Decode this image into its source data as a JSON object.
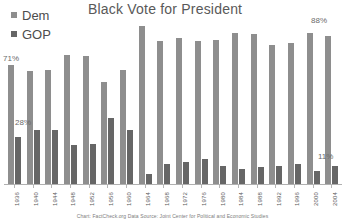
{
  "chart_data": {
    "type": "bar",
    "title": "Black Vote for President",
    "xlabel": "",
    "ylabel": "",
    "ylim": [
      0,
      100
    ],
    "grid": false,
    "legend_position": "top-left",
    "categories": [
      "1936",
      "1940",
      "1944",
      "1948",
      "1952",
      "1956",
      "1960",
      "1964",
      "1968",
      "1972",
      "1976",
      "1980",
      "1984",
      "1988",
      "1992",
      "1996",
      "2000",
      "2004"
    ],
    "series": [
      {
        "name": "Dem",
        "color": "#8e8e8e",
        "values": [
          71,
          67,
          68,
          77,
          76,
          61,
          68,
          94,
          85,
          87,
          85,
          86,
          90,
          89,
          83,
          84,
          90,
          88
        ]
      },
      {
        "name": "GOP",
        "color": "#666666",
        "values": [
          28,
          32,
          32,
          23,
          24,
          39,
          32,
          6,
          12,
          13,
          15,
          11,
          9,
          10,
          11,
          12,
          8,
          11
        ]
      }
    ],
    "annotations": [
      {
        "id": "label-71",
        "text": "71%",
        "series": "Dem",
        "category": "1936",
        "value": 71
      },
      {
        "id": "label-28",
        "text": "28%",
        "series": "GOP",
        "category": "1936",
        "value": 28
      },
      {
        "id": "label-88",
        "text": "88%",
        "series": "Dem",
        "category": "2004",
        "value": 88
      },
      {
        "id": "label-11",
        "text": "11%",
        "series": "GOP",
        "category": "2004",
        "value": 11
      }
    ],
    "caption": "Chart: FactCheck.org     Data Source:  Joint Center for Political and Economic Studies"
  },
  "legend": {
    "items": [
      {
        "label": "Dem",
        "color": "#8e8e8e"
      },
      {
        "label": "GOP",
        "color": "#666666"
      }
    ]
  }
}
